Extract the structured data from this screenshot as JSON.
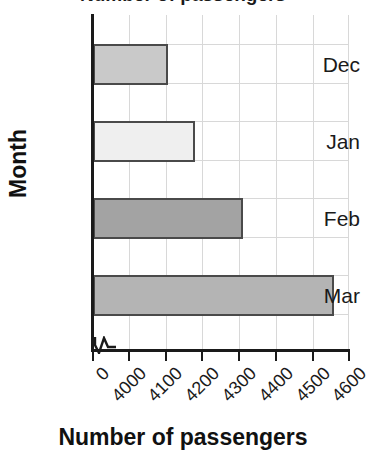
{
  "chart_data": {
    "type": "bar",
    "orientation": "horizontal",
    "title": "Number of passengers",
    "categories": [
      "Dec",
      "Jan",
      "Feb",
      "Mar"
    ],
    "values": [
      4105,
      4180,
      4310,
      4560
    ],
    "series": [
      {
        "name": "Number of passengers",
        "values": [
          4105,
          4180,
          4310,
          4560
        ]
      }
    ],
    "xlabel": "Number of passengers",
    "ylabel": "Month",
    "xlim": [
      4000,
      4600
    ],
    "xticks": [
      "0",
      "4000",
      "4100",
      "4200",
      "4300",
      "4400",
      "4500",
      "4600"
    ],
    "xtick_values": [
      0,
      4000,
      4100,
      4200,
      4300,
      4400,
      4500,
      4600
    ],
    "xtick_rotation": -45,
    "axis_break": true,
    "grid": "vertical-and-horizontal",
    "legend": "none",
    "bar_colors": [
      "#c9c9c9",
      "#efefef",
      "#a3a3a3",
      "#b4b4b4"
    ],
    "bar_edge_color": "#4a4a4a",
    "grid_color": "#d8d8d8",
    "axis_color": "#1a1a1a",
    "bars": [
      {
        "category": "Dec",
        "value": 4105,
        "color": "#c9c9c9"
      },
      {
        "category": "Jan",
        "value": 4180,
        "color": "#efefef"
      },
      {
        "category": "Feb",
        "value": 4310,
        "color": "#a3a3a3"
      },
      {
        "category": "Mar",
        "value": 4560,
        "color": "#b4b4b4"
      }
    ]
  }
}
